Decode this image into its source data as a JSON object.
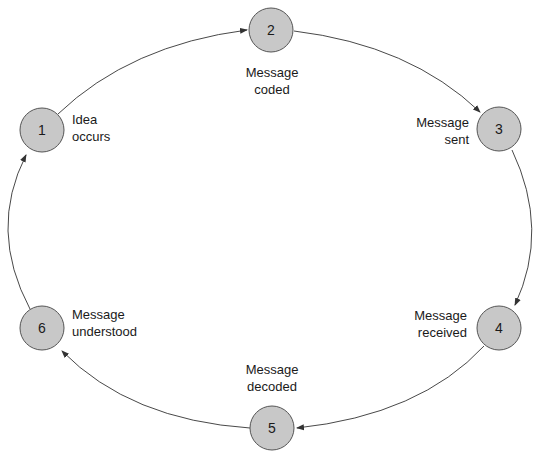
{
  "diagram": {
    "title": "",
    "type": "cycle",
    "node_fill": "#c8c8c8",
    "node_stroke": "#555555",
    "edge_color": "#333333",
    "nodes": [
      {
        "id": "1",
        "number": "1",
        "label_lines": [
          "Idea",
          "occurs"
        ]
      },
      {
        "id": "2",
        "number": "2",
        "label_lines": [
          "Message",
          "coded"
        ]
      },
      {
        "id": "3",
        "number": "3",
        "label_lines": [
          "Message",
          "sent"
        ]
      },
      {
        "id": "4",
        "number": "4",
        "label_lines": [
          "Message",
          "received"
        ]
      },
      {
        "id": "5",
        "number": "5",
        "label_lines": [
          "Message",
          "decoded"
        ]
      },
      {
        "id": "6",
        "number": "6",
        "label_lines": [
          "Message",
          "understood"
        ]
      }
    ],
    "edges": [
      {
        "from": "1",
        "to": "2"
      },
      {
        "from": "2",
        "to": "3"
      },
      {
        "from": "3",
        "to": "4"
      },
      {
        "from": "4",
        "to": "5"
      },
      {
        "from": "5",
        "to": "6"
      },
      {
        "from": "6",
        "to": "1"
      }
    ]
  }
}
